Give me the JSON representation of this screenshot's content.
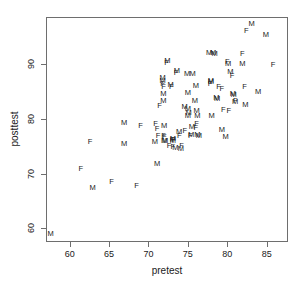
{
  "chart_data": {
    "type": "scatter",
    "title": "",
    "xlabel": "pretest",
    "ylabel": "posttest",
    "xlim": [
      57.0,
      87.7
    ],
    "ylim": [
      57.5,
      98.6
    ],
    "xticks": [
      60,
      65,
      70,
      75,
      80,
      85
    ],
    "yticks": [
      60,
      70,
      80,
      90
    ],
    "grid": false,
    "legend": null,
    "marker_style": "text-glyph",
    "marker_note": "Each observation is plotted as the letter of its group: M or F",
    "groups": [
      "M",
      "F"
    ],
    "series": [
      {
        "name": "M",
        "label": "M",
        "points": [
          [
            57.6,
            59.0
          ],
          [
            62.9,
            67.4
          ],
          [
            66.9,
            79.3
          ],
          [
            66.9,
            75.4
          ],
          [
            70.8,
            75.7
          ],
          [
            71.1,
            71.8
          ],
          [
            71.8,
            87.4
          ],
          [
            71.8,
            86.9
          ],
          [
            71.9,
            84.5
          ],
          [
            71.9,
            83.2
          ],
          [
            72.0,
            78.7
          ],
          [
            72.0,
            76.0
          ],
          [
            72.1,
            75.9
          ],
          [
            72.4,
            90.5
          ],
          [
            72.8,
            86.2
          ],
          [
            73.1,
            76.3
          ],
          [
            73.1,
            75.9
          ],
          [
            73.4,
            74.6
          ],
          [
            73.6,
            88.8
          ],
          [
            73.9,
            77.6
          ],
          [
            74.1,
            74.4
          ],
          [
            74.6,
            82.1
          ],
          [
            74.9,
            88.2
          ],
          [
            75.0,
            84.8
          ],
          [
            75.0,
            81.8
          ],
          [
            75.0,
            80.5
          ],
          [
            75.1,
            81.0
          ],
          [
            75.4,
            77.1
          ],
          [
            75.5,
            78.5
          ],
          [
            75.6,
            88.1
          ],
          [
            75.9,
            83.3
          ],
          [
            76.0,
            86.0
          ],
          [
            76.1,
            81.5
          ],
          [
            76.2,
            80.6
          ],
          [
            76.2,
            77.0
          ],
          [
            76.4,
            76.9
          ],
          [
            77.7,
            92.0
          ],
          [
            77.9,
            87.0
          ],
          [
            77.9,
            86.8
          ],
          [
            78.0,
            80.6
          ],
          [
            78.2,
            92.0
          ],
          [
            78.4,
            91.9
          ],
          [
            78.6,
            83.8
          ],
          [
            78.7,
            83.6
          ],
          [
            79.3,
            77.9
          ],
          [
            79.8,
            76.7
          ],
          [
            80.1,
            90.0
          ],
          [
            80.4,
            88.6
          ],
          [
            80.7,
            84.6
          ],
          [
            80.8,
            84.3
          ],
          [
            81.0,
            83.0
          ],
          [
            81.9,
            90.0
          ],
          [
            82.3,
            82.6
          ],
          [
            83.1,
            97.3
          ],
          [
            83.9,
            84.9
          ],
          [
            84.9,
            95.3
          ]
        ]
      },
      {
        "name": "F",
        "label": "F",
        "points": [
          [
            61.4,
            70.8
          ],
          [
            62.6,
            75.8
          ],
          [
            65.3,
            68.5
          ],
          [
            68.5,
            67.7
          ],
          [
            69.0,
            78.6
          ],
          [
            70.9,
            79.0
          ],
          [
            71.1,
            78.2
          ],
          [
            71.2,
            76.8
          ],
          [
            71.4,
            82.3
          ],
          [
            71.8,
            86.3
          ],
          [
            71.9,
            85.8
          ],
          [
            71.9,
            76.9
          ],
          [
            72.0,
            76.6
          ],
          [
            72.3,
            90.2
          ],
          [
            72.6,
            75.1
          ],
          [
            72.9,
            85.9
          ],
          [
            73.0,
            76.2
          ],
          [
            73.1,
            74.8
          ],
          [
            73.2,
            76.2
          ],
          [
            73.5,
            88.3
          ],
          [
            73.9,
            76.9
          ],
          [
            74.2,
            75.0
          ],
          [
            74.6,
            77.8
          ],
          [
            75.3,
            76.9
          ],
          [
            76.0,
            78.3
          ],
          [
            76.1,
            79.0
          ],
          [
            77.8,
            86.3
          ],
          [
            78.9,
            85.9
          ],
          [
            79.3,
            85.4
          ],
          [
            79.5,
            81.6
          ],
          [
            80.0,
            90.3
          ],
          [
            80.2,
            81.5
          ],
          [
            80.6,
            87.9
          ],
          [
            81.0,
            83.3
          ],
          [
            81.9,
            91.9
          ],
          [
            82.2,
            85.9
          ],
          [
            82.4,
            96.0
          ],
          [
            85.8,
            89.8
          ]
        ]
      }
    ]
  },
  "axes": {
    "x_tick_labels": [
      "60",
      "65",
      "70",
      "75",
      "80",
      "85"
    ],
    "y_tick_labels": [
      "60",
      "70",
      "80",
      "90"
    ],
    "x_title": "pretest",
    "y_title": "posttest"
  },
  "style": {
    "frame_color": "#6e6e6e",
    "text_color": "#1a1a1a",
    "background": "#ffffff"
  }
}
